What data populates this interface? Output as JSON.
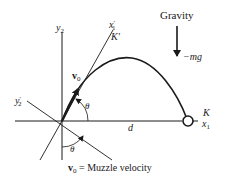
{
  "diagram": {
    "gravity_label": "Gravity",
    "force_label": "−mg",
    "axes": {
      "y2": "y",
      "y2_sub": "2",
      "y2_prime": "y",
      "y2_prime_sub": "2",
      "y2_prime_mark": "′",
      "x1_prime": "x",
      "x1_prime_sub": "1",
      "x1_prime_mark": "′",
      "frame_prime": "K′",
      "frame": "K",
      "x1": "x",
      "x1_sub": "1"
    },
    "velocity_label": "v",
    "velocity_sub": "0",
    "angle_top": "θ",
    "angle_bottom": "θ",
    "distance_label": "d",
    "caption": {
      "symbol": "v",
      "symbol_sub": "0",
      "text": " = Muzzle velocity"
    },
    "colors": {
      "ink": "#1a1a1a",
      "background": "#ffffff"
    }
  }
}
